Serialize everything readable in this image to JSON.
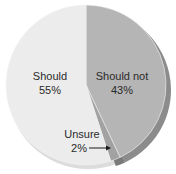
{
  "chart_data": {
    "type": "pie",
    "title": "",
    "categories": [
      "Should not",
      "Unsure",
      "Should"
    ],
    "values": [
      43,
      2,
      55
    ],
    "unit": "%",
    "labels": [
      {
        "name": "Should not",
        "value_text": "43%"
      },
      {
        "name": "Unsure",
        "value_text": "2%"
      },
      {
        "name": "Should",
        "value_text": "55%"
      }
    ],
    "colors": {
      "Should not": "#b5b5b5",
      "Unsure": "#a2a2a2",
      "Should": "#ececec",
      "edge_dark": "#8c8c8c",
      "edge_light": "#dcdcdc",
      "text": "#2a2a2a"
    },
    "start_angle_deg": -90,
    "direction": "clockwise",
    "style": "3d-tilted",
    "legend": "none",
    "annotations": [
      {
        "text": "Unsure 2%",
        "arrow_to": "Unsure slice"
      }
    ]
  }
}
